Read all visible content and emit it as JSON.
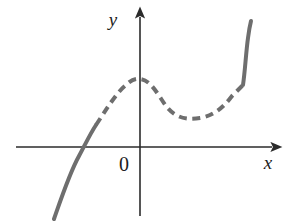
{
  "figure": {
    "background_color": "#ffffff",
    "width": 288,
    "height": 221
  },
  "axes": {
    "color": "#2b2b2b",
    "stroke_width": 1.6,
    "x_axis": {
      "label": "x",
      "label_x": 268,
      "label_y": 169,
      "y_position": 147,
      "start_x": 16,
      "end_x": 272,
      "arrow": "right-arrow"
    },
    "y_axis": {
      "label": "y",
      "label_x": 113,
      "label_y": 26,
      "x_position": 140,
      "start_y": 216,
      "end_y": 17,
      "arrow": "up-arrow"
    },
    "origin": {
      "label": "0",
      "label_x": 119,
      "label_y": 171
    }
  },
  "curve": {
    "color": "#6e6e6e",
    "stroke_width": 4,
    "dash_pattern": "8 5.5",
    "segments": [
      {
        "name": "left-solid-segment",
        "style": "solid",
        "path": "M 54 219 C 62 196 70 172 79 156 C 85 145 90 134 96 125"
      },
      {
        "name": "middle-dashed-segment",
        "style": "dashed",
        "path": "M 96 125 C 106 110 116 93 126 85 C 131 80 136 78 140 79 C 151 80 158 95 166 106 C 176 119 188 120 200 118 C 213 116 223 108 232 96 C 237 91 240 88 243 85"
      },
      {
        "name": "right-solid-segment",
        "style": "solid",
        "path": "M 243 85 C 245 72 246 52 248 38 C 249 30 250 25 251 21"
      }
    ]
  },
  "chart_data": {
    "type": "line",
    "title": "",
    "xlabel": "x",
    "ylabel": "y",
    "grid": false,
    "legend": false,
    "annotations": [
      "x-intercept of solid left branch",
      "local maximum on the y-axis",
      "local minimum right of the y-axis"
    ],
    "series": [
      {
        "name": "cubic-curve",
        "style": "solid-dashed-solid",
        "color": "#6e6e6e",
        "points_pixel": [
          [
            54,
            219
          ],
          [
            70,
            172
          ],
          [
            82,
            147
          ],
          [
            96,
            125
          ],
          [
            116,
            93
          ],
          [
            140,
            79
          ],
          [
            166,
            106
          ],
          [
            200,
            118
          ],
          [
            232,
            96
          ],
          [
            243,
            85
          ],
          [
            248,
            38
          ],
          [
            251,
            21
          ]
        ],
        "features": {
          "x_intercept_pixel": [
            82,
            147
          ],
          "local_maximum_pixel": [
            140,
            79
          ],
          "local_minimum_pixel": [
            200,
            118
          ],
          "solid_to_dashed_pixel": [
            96,
            125
          ],
          "dashed_to_solid_pixel": [
            243,
            85
          ]
        }
      }
    ]
  }
}
